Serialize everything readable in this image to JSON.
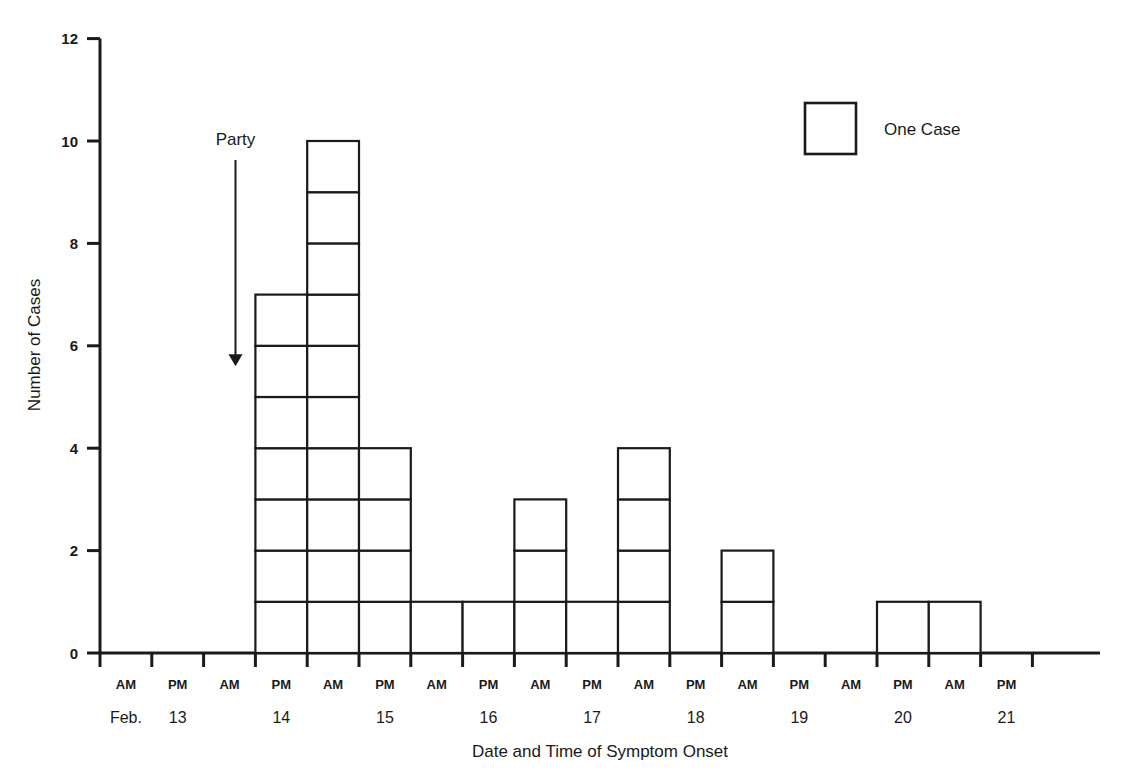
{
  "chart_data": {
    "type": "bar",
    "title": "",
    "xlabel": "Date and Time of Symptom Onset",
    "ylabel": "Number of Cases",
    "ylim": [
      0,
      12
    ],
    "ytick_values": [
      0,
      2,
      4,
      6,
      8,
      10,
      12
    ],
    "ytick_labels": [
      "0",
      "2",
      "4",
      "6",
      "8",
      "10",
      "12"
    ],
    "grid": false,
    "bin_width_label": "half day",
    "categories": [
      "Feb. 13 AM",
      "Feb. 13 PM",
      "Feb. 14 AM",
      "Feb. 14 PM",
      "Feb. 15 AM",
      "Feb. 15 PM",
      "Feb. 16 AM",
      "Feb. 16 PM",
      "Feb. 17 AM",
      "Feb. 17 PM",
      "Feb. 18 AM",
      "Feb. 18 PM",
      "Feb. 19 AM",
      "Feb. 19 PM",
      "Feb. 20 AM",
      "Feb. 20 PM",
      "Feb. 21 AM",
      "Feb. 21 PM"
    ],
    "values": [
      0,
      0,
      0,
      7,
      10,
      4,
      1,
      1,
      3,
      1,
      4,
      0,
      2,
      0,
      0,
      1,
      1,
      0
    ],
    "time_ticks": [
      "AM",
      "PM",
      "AM",
      "PM",
      "AM",
      "PM",
      "AM",
      "PM",
      "AM",
      "PM",
      "AM",
      "PM",
      "AM",
      "PM",
      "AM",
      "PM",
      "AM",
      "PM"
    ],
    "day_labels": [
      {
        "text": "Feb.",
        "bin_index": 0
      },
      {
        "text": "13",
        "bin_index": 1
      },
      {
        "text": "14",
        "bin_index": 3
      },
      {
        "text": "15",
        "bin_index": 5
      },
      {
        "text": "16",
        "bin_index": 7
      },
      {
        "text": "17",
        "bin_index": 9
      },
      {
        "text": "18",
        "bin_index": 11
      },
      {
        "text": "19",
        "bin_index": 13
      },
      {
        "text": "20",
        "bin_index": 15
      },
      {
        "text": "21",
        "bin_index": 17
      }
    ],
    "annotations": [
      {
        "name": "party-annotation",
        "text": "Party",
        "bin_index": 2,
        "points_to_y": 5.6
      }
    ],
    "legend": {
      "position": "top-right",
      "entries": [
        {
          "label": "One Case",
          "symbol": "square-outline"
        }
      ]
    },
    "total_cases": 34,
    "colors": {
      "line": "#1a1a1a",
      "cell_fill": "#ffffff",
      "background": "#ffffff"
    }
  },
  "axis": {
    "y_title": "Number of Cases",
    "x_title": "Date and Time of Symptom Onset"
  },
  "legend": {
    "one_case_label": "One Case"
  },
  "annotation": {
    "party_label": "Party"
  }
}
